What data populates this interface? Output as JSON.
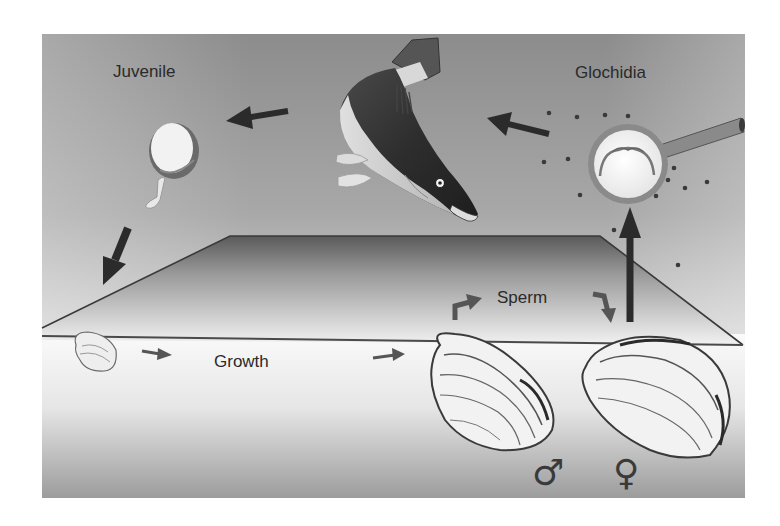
{
  "diagram": {
    "type": "life-cycle",
    "labels": {
      "juvenile": "Juvenile",
      "glochidia": "Glochidia",
      "sperm": "Sperm",
      "growth": "Growth",
      "male_symbol": "♂",
      "female_symbol": "♀"
    },
    "stages": [
      {
        "id": "female-mussel",
        "label": "♀"
      },
      {
        "id": "glochidia",
        "label": "Glochidia"
      },
      {
        "id": "host-fish",
        "label": ""
      },
      {
        "id": "juvenile",
        "label": "Juvenile"
      },
      {
        "id": "small-mussel",
        "label": ""
      },
      {
        "id": "male-mussel",
        "label": "♂"
      }
    ],
    "flow": [
      "female-mussel -> glochidia",
      "glochidia -> host-fish",
      "host-fish -> juvenile",
      "juvenile -> small-mussel (settles on substrate)",
      "small-mussel -> male-mussel (Growth)",
      "male-mussel -> female-mussel (Sperm)"
    ],
    "colors": {
      "water_top": "#8e8e8e",
      "water_bottom": "#d8d8d8",
      "sediment_top": "#f4f4f4",
      "sediment_bottom": "#9a9a9a",
      "arrow": "#2b2b2b",
      "text": "#2a2a2a"
    }
  }
}
